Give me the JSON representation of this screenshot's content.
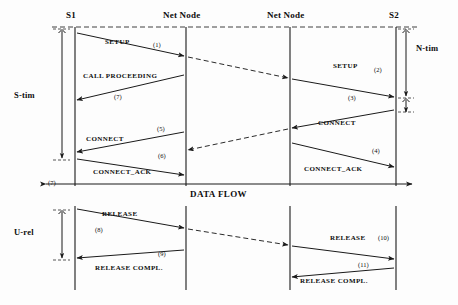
{
  "diagram": {
    "lifelines": [
      {
        "id": "s1",
        "label": "S1",
        "x": 75
      },
      {
        "id": "nn1",
        "label": "Net Node",
        "x": 186
      },
      {
        "id": "nn2",
        "label": "Net Node",
        "x": 290
      },
      {
        "id": "s2",
        "label": "S2",
        "x": 396
      }
    ],
    "side_labels": [
      {
        "id": "s-time",
        "label": "S-tim",
        "x": 14,
        "y": 95
      },
      {
        "id": "u-release",
        "label": "U-rel",
        "x": 14,
        "y": 232
      },
      {
        "id": "n-time",
        "label": "N-tim",
        "x": 415,
        "y": 47
      }
    ],
    "flow_label": {
      "label": "DATA FLOW",
      "x": 190,
      "y": 188
    },
    "flow_number": {
      "label": "(7)",
      "x": 48,
      "y": 183
    },
    "messages": [
      {
        "id": "setup-1",
        "label": "SETUP",
        "number": "(1)",
        "label_x": 105,
        "label_y": 42,
        "num_x": 153,
        "num_y": 44
      },
      {
        "id": "call-proceeding",
        "label": "CALL PROCEEDING",
        "number": "(7)",
        "label_x": 83,
        "label_y": 76,
        "num_x": 114,
        "num_y": 97
      },
      {
        "id": "setup-2",
        "label": "SETUP",
        "number": "(2)",
        "label_x": 333,
        "label_y": 66,
        "num_x": 374,
        "num_y": 70
      },
      {
        "id": "alerting-3",
        "label": "",
        "number": "(3)",
        "label_x": 0,
        "label_y": 0,
        "num_x": 348,
        "num_y": 98
      },
      {
        "id": "connect-left",
        "label": "CONNECT",
        "number": "(5)",
        "label_x": 86,
        "label_y": 140,
        "num_x": 157,
        "num_y": 129
      },
      {
        "id": "connect-right",
        "label": "CONNECT",
        "number": "",
        "label_x": 318,
        "label_y": 123,
        "num_x": 0,
        "num_y": 0
      },
      {
        "id": "connect-ack-left",
        "label": "CONNECT_ACK",
        "number": "(6)",
        "label_x": 93,
        "label_y": 172,
        "num_x": 158,
        "num_y": 156
      },
      {
        "id": "connect-ack-right",
        "label": "CONNECT_ACK",
        "number": "(4)",
        "label_x": 304,
        "label_y": 169,
        "num_x": 372,
        "num_y": 151
      },
      {
        "id": "release-left",
        "label": "RELEASE",
        "number": "(8)",
        "label_x": 102,
        "label_y": 214,
        "num_x": 95,
        "num_y": 230
      },
      {
        "id": "release-right",
        "label": "RELEASE",
        "number": "(10)",
        "label_x": 330,
        "label_y": 238,
        "num_x": 378,
        "num_y": 238
      },
      {
        "id": "release-compl-left",
        "label": "RELEASE COMPL.",
        "number": "(9)",
        "label_x": 95,
        "label_y": 268,
        "num_x": 158,
        "num_y": 254
      },
      {
        "id": "release-compl-right",
        "label": "RELEASE COMPL.",
        "number": "(11)",
        "label_x": 300,
        "label_y": 281,
        "num_x": 358,
        "num_y": 265
      }
    ],
    "colors": {
      "line": "#1a1a1a",
      "dashed": "#2b2b2b",
      "text": "#0d0d0d",
      "background": "#fdfdfd"
    }
  }
}
